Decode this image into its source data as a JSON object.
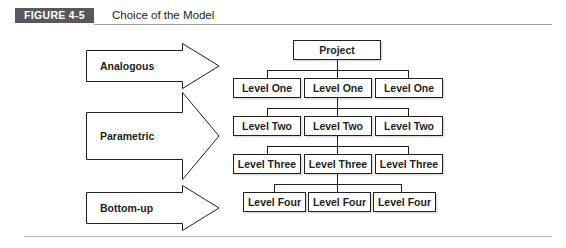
{
  "figure": {
    "label": "FIGURE 4-5",
    "caption": "Choice of the Model",
    "badge_color": "#58585a",
    "text_color": "#231f20",
    "background": "#ffffff"
  },
  "estimating_methods": [
    {
      "label": "Analogous",
      "order": 1
    },
    {
      "label": "Parametric",
      "order": 2
    },
    {
      "label": "Bottom-up",
      "order": 3
    }
  ],
  "tree": {
    "root": {
      "label": "Project"
    },
    "levels": [
      {
        "name": "Level One",
        "nodes": [
          "Level One",
          "Level One",
          "Level One"
        ]
      },
      {
        "name": "Level Two",
        "nodes": [
          "Level Two",
          "Level Two",
          "Level Two"
        ]
      },
      {
        "name": "Level Three",
        "nodes": [
          "Level Three",
          "Level Three",
          "Level Three"
        ]
      },
      {
        "name": "Level Four",
        "nodes": [
          "Level Four",
          "Level Four",
          "Level Four"
        ]
      }
    ]
  }
}
